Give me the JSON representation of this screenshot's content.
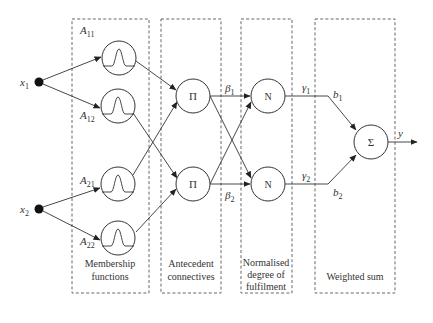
{
  "diagram": {
    "type": "neuro-fuzzy network (ANFIS-style)",
    "inputs": [
      {
        "id": "x1",
        "label": "x",
        "sub": "1"
      },
      {
        "id": "x2",
        "label": "x",
        "sub": "2"
      }
    ],
    "layers": [
      {
        "id": "membership",
        "caption_lines": [
          "Membership",
          "functions"
        ]
      },
      {
        "id": "antecedent",
        "caption_lines": [
          "Antecedent",
          "connectives"
        ]
      },
      {
        "id": "normalised",
        "caption_lines": [
          "Normalised",
          "degree of",
          "fulfilment"
        ]
      },
      {
        "id": "weighted",
        "caption_lines": [
          "Weighted sum"
        ]
      }
    ],
    "membership_nodes": [
      {
        "id": "A11",
        "label": "A",
        "sub": "11",
        "icon": "gaussian-bell-icon"
      },
      {
        "id": "A12",
        "label": "A",
        "sub": "12",
        "icon": "gaussian-bell-icon"
      },
      {
        "id": "A21",
        "label": "A",
        "sub": "21",
        "icon": "gaussian-bell-icon"
      },
      {
        "id": "A22",
        "label": "A",
        "sub": "22",
        "icon": "gaussian-bell-icon"
      }
    ],
    "product_nodes": [
      {
        "id": "P1",
        "symbol": "Π",
        "out_label": "β",
        "out_sub": "1"
      },
      {
        "id": "P2",
        "symbol": "Π",
        "out_label": "β",
        "out_sub": "2"
      }
    ],
    "norm_nodes": [
      {
        "id": "N1",
        "symbol": "N",
        "out_label": "γ",
        "out_sub": "1"
      },
      {
        "id": "N2",
        "symbol": "N",
        "out_label": "γ",
        "out_sub": "2"
      }
    ],
    "weights": [
      {
        "label": "b",
        "sub": "1"
      },
      {
        "label": "b",
        "sub": "2"
      }
    ],
    "sum_node": {
      "symbol": "Σ"
    },
    "output": {
      "label": "y"
    },
    "edges": [
      [
        "x1",
        "A11"
      ],
      [
        "x1",
        "A12"
      ],
      [
        "x2",
        "A21"
      ],
      [
        "x2",
        "A22"
      ],
      [
        "A11",
        "P1"
      ],
      [
        "A12",
        "P2"
      ],
      [
        "A21",
        "P1"
      ],
      [
        "A22",
        "P2"
      ],
      [
        "P1",
        "N1"
      ],
      [
        "P1",
        "N2"
      ],
      [
        "P2",
        "N1"
      ],
      [
        "P2",
        "N2"
      ],
      [
        "N1",
        "S"
      ],
      [
        "N2",
        "S"
      ],
      [
        "S",
        "y"
      ]
    ]
  }
}
